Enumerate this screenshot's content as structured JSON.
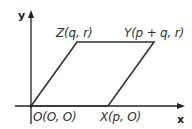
{
  "diagram": {
    "type": "parallelogram-on-coordinate-axes",
    "axes": {
      "x_label": "x",
      "y_label": "y"
    },
    "vertices": [
      {
        "id": "O",
        "label": "O(O, O)",
        "coords": "(0, 0)"
      },
      {
        "id": "X",
        "label": "X(p, O)",
        "coords": "(p, 0)"
      },
      {
        "id": "Y",
        "label": "Y(p + q, r)",
        "coords": "(p + q, r)"
      },
      {
        "id": "Z",
        "label": "Z(q, r)",
        "coords": "(q, r)"
      }
    ],
    "colors": {
      "line": "#333333",
      "axis": "#222222",
      "background": "#ffffff"
    }
  }
}
